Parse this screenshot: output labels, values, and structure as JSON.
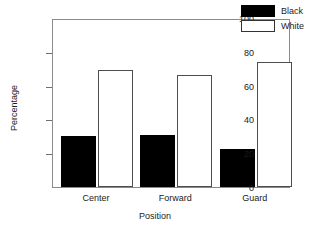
{
  "chart_data": {
    "type": "bar",
    "title": "",
    "xlabel": "Position",
    "ylabel": "Percentage",
    "categories": [
      "Center",
      "Forward",
      "Guard"
    ],
    "series": [
      {
        "name": "Black",
        "color": "#000000",
        "values": [
          30,
          31,
          22.5
        ]
      },
      {
        "name": "White",
        "color": "#ffffff",
        "values": [
          69,
          66,
          74
        ]
      }
    ],
    "ylim": [
      0,
      100
    ],
    "yticks": [
      0,
      20,
      40,
      60,
      80,
      100
    ],
    "ytick_labels": [
      "0",
      "20",
      "40",
      "60",
      "80",
      "100"
    ],
    "grid": false,
    "legend_position": "top-right"
  },
  "legend": {
    "entries": [
      {
        "label": "Black",
        "swatch": "filled-black"
      },
      {
        "label": "White",
        "swatch": "outlined-white"
      }
    ]
  },
  "axes": {
    "x_title": "Position",
    "y_title": "Percentage"
  }
}
